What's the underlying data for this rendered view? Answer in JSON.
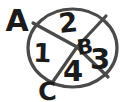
{
  "diagram": {
    "background_color": "#ffffff",
    "line_color": "#4a4a4a",
    "text_color": "#1b1b1b",
    "line_width": 3.2,
    "circle": {
      "cx": 72.5,
      "cy": 48,
      "rx": 44.5,
      "ry": 39
    },
    "hub": {
      "x": 77,
      "y": 47
    },
    "dividers": [
      {
        "name": "divider-upper-left",
        "x1": 77,
        "y1": 47,
        "x2": 33,
        "y2": 23
      },
      {
        "name": "divider-upper-right",
        "x1": 77,
        "y1": 47,
        "x2": 106,
        "y2": 16
      },
      {
        "name": "divider-lower-left",
        "x1": 77,
        "y1": 47,
        "x2": 52,
        "y2": 83
      },
      {
        "name": "divider-lower-right",
        "x1": 77,
        "y1": 47,
        "x2": 108,
        "y2": 77
      }
    ],
    "labels": [
      {
        "name": "outer-label-a",
        "text": "A",
        "x": 17,
        "y": 31,
        "size": 30,
        "rotate": 0
      },
      {
        "name": "sector-number-2",
        "text": "2",
        "x": 69,
        "y": 32,
        "size": 27,
        "rotate": -6
      },
      {
        "name": "sector-number-1",
        "text": "1",
        "x": 42,
        "y": 62,
        "size": 26,
        "rotate": 2
      },
      {
        "name": "center-label-b",
        "text": "B",
        "x": 86,
        "y": 54,
        "size": 21,
        "rotate": -8
      },
      {
        "name": "sector-number-3",
        "text": "3",
        "x": 100,
        "y": 69,
        "size": 29,
        "rotate": 0
      },
      {
        "name": "sector-number-4",
        "text": "4",
        "x": 73,
        "y": 81,
        "size": 29,
        "rotate": 0
      },
      {
        "name": "outer-label-c",
        "text": "C",
        "x": 48,
        "y": 100,
        "size": 25,
        "rotate": -4
      }
    ]
  }
}
